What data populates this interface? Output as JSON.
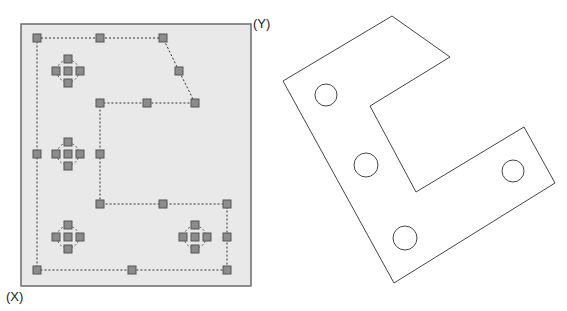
{
  "labels": {
    "y_axis": "(Y)",
    "x_axis": "(X)"
  },
  "colors": {
    "panel_fill": "#e9e9e9",
    "panel_border": "#6b6b6b",
    "grip_fill": "#8c8c8c",
    "grip_border": "#555555",
    "dash_line": "#333333",
    "part_stroke": "#444444"
  },
  "left_panel": {
    "rect": {
      "x": 21,
      "y": 24,
      "w": 230,
      "h": 262
    },
    "outline_path": [
      [
        37,
        38
      ],
      [
        100,
        38
      ],
      [
        163,
        38
      ],
      [
        179,
        71
      ],
      [
        195,
        103
      ],
      [
        147,
        103
      ],
      [
        100,
        103
      ],
      [
        100,
        154
      ],
      [
        100,
        204
      ],
      [
        163,
        204
      ],
      [
        227,
        204
      ],
      [
        227,
        237
      ],
      [
        227,
        270
      ],
      [
        132,
        270
      ],
      [
        37,
        270
      ],
      [
        37,
        154
      ],
      [
        37,
        38
      ]
    ],
    "grips": [
      [
        37,
        38
      ],
      [
        100,
        38
      ],
      [
        163,
        38
      ],
      [
        179,
        71
      ],
      [
        195,
        103
      ],
      [
        147,
        103
      ],
      [
        100,
        103
      ],
      [
        100,
        154
      ],
      [
        100,
        204
      ],
      [
        163,
        204
      ],
      [
        227,
        204
      ],
      [
        227,
        237
      ],
      [
        227,
        270
      ],
      [
        132,
        270
      ],
      [
        37,
        270
      ],
      [
        37,
        154
      ]
    ],
    "hole_clusters": [
      {
        "cx": 68,
        "cy": 71,
        "r": 11,
        "spacing": 12
      },
      {
        "cx": 68,
        "cy": 154,
        "r": 11,
        "spacing": 12
      },
      {
        "cx": 68,
        "cy": 237,
        "r": 11,
        "spacing": 12
      },
      {
        "cx": 195,
        "cy": 237,
        "r": 11,
        "spacing": 12
      }
    ]
  },
  "right_part": {
    "outline": [
      [
        392,
        16
      ],
      [
        450,
        57
      ],
      [
        370,
        106
      ],
      [
        416,
        192
      ],
      [
        524,
        127
      ],
      [
        555,
        183
      ],
      [
        394,
        283
      ],
      [
        283,
        81
      ]
    ],
    "holes": [
      {
        "cx": 326,
        "cy": 95,
        "r": 11
      },
      {
        "cx": 366,
        "cy": 165,
        "r": 12
      },
      {
        "cx": 513,
        "cy": 171,
        "r": 11
      },
      {
        "cx": 405,
        "cy": 238,
        "r": 12
      }
    ]
  }
}
